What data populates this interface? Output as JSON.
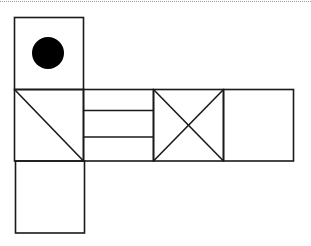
{
  "figure": {
    "type": "cube-net",
    "stroke_color": "#1a1a1a",
    "fill_dot_color": "#000000",
    "faces": [
      {
        "id": "top",
        "pattern": "filled-circle",
        "col": 0,
        "row": 0
      },
      {
        "id": "left",
        "pattern": "single-diagonal",
        "col": 0,
        "row": 1
      },
      {
        "id": "front",
        "pattern": "two-horizontal-lines",
        "col": 1,
        "row": 1
      },
      {
        "id": "right",
        "pattern": "x-cross",
        "col": 2,
        "row": 1
      },
      {
        "id": "back",
        "pattern": "blank",
        "col": 3,
        "row": 1
      },
      {
        "id": "bottom",
        "pattern": "blank",
        "col": 0,
        "row": 2
      }
    ]
  }
}
